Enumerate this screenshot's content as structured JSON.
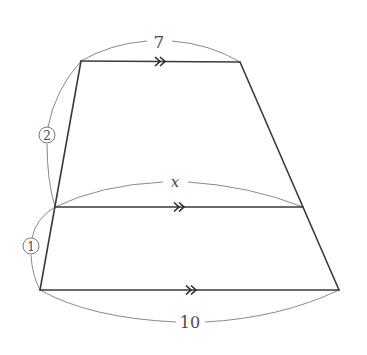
{
  "diagram": {
    "type": "trapezoid-with-midline",
    "vertices": {
      "top_left": [
        81,
        61
      ],
      "top_right": [
        240,
        62
      ],
      "mid_left": [
        55,
        207
      ],
      "mid_right": [
        303,
        207
      ],
      "bottom_left": [
        40,
        290
      ],
      "bottom_right": [
        339,
        290
      ]
    },
    "labels": {
      "top_length": "7",
      "middle_length": "x",
      "bottom_length": "10",
      "upper_ratio": "2",
      "lower_ratio": "1"
    },
    "parallel_marker": "double-chevron",
    "colors": {
      "edge": "#3a3a3a",
      "measure_arc": "#8a8a8a",
      "label": "#4a4a4a"
    }
  }
}
